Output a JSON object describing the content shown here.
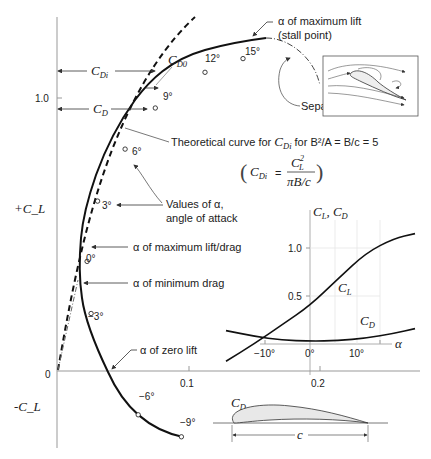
{
  "chart_data": {
    "type": "line",
    "xlabel": "C_D",
    "ylabel_positive": "+C_L",
    "ylabel_negative": "-C_L",
    "xlim": [
      0,
      0.3
    ],
    "ylim": [
      -0.3,
      1.3
    ],
    "x_ticks": [
      "0.1",
      "0.2"
    ],
    "y_ticks": [
      "1.0"
    ],
    "origin_label": "0",
    "series": [
      {
        "name": "Measured drag polar",
        "style": "solid",
        "points": [
          {
            "alpha": "-9°",
            "cd": 0.095,
            "cl": -0.24
          },
          {
            "alpha": "-6°",
            "cd": 0.062,
            "cl": -0.16
          },
          {
            "alpha": "-3°",
            "cd": 0.026,
            "cl": 0.21
          },
          {
            "alpha": "0°",
            "cd": 0.023,
            "cl": 0.4
          },
          {
            "alpha": "3°",
            "cd": 0.031,
            "cl": 0.62
          },
          {
            "alpha": "6°",
            "cd": 0.052,
            "cl": 0.81
          },
          {
            "alpha": "9°",
            "cd": 0.075,
            "cl": 0.96
          },
          {
            "alpha": "12°",
            "cd": 0.113,
            "cl": 1.09
          },
          {
            "alpha": "15°",
            "cd": 0.142,
            "cl": 1.14
          }
        ]
      },
      {
        "name": "Theoretical curve for C_Di",
        "style": "dashed",
        "points": [
          {
            "cd": 0.0,
            "cl": 0.0
          },
          {
            "cd": 0.01,
            "cl": 0.25
          },
          {
            "cd": 0.025,
            "cl": 0.5
          },
          {
            "cd": 0.045,
            "cl": 0.75
          },
          {
            "cd": 0.065,
            "cl": 1.0
          },
          {
            "cd": 0.09,
            "cl": 1.22
          }
        ]
      }
    ],
    "annotations": {
      "max_lift": "α of maximum lift",
      "max_lift_sub": "(stall point)",
      "separation": "Separation",
      "theory_line": "Theoretical curve for",
      "theory_cdi": "C",
      "theory_cdi_sub": "Di",
      "theory_rest": " for B²/A = B/c = 5",
      "formula_lhs": "C",
      "formula_lhs_sub": "Di",
      "formula_eq": "=",
      "formula_num": "C",
      "formula_num_sup": "2",
      "formula_num_sub": "L",
      "formula_den": "πB/c",
      "values_alpha_1": "Values of α,",
      "values_alpha_2": "angle of attack",
      "max_lift_drag": "α of maximum lift/drag",
      "min_drag": "α of minimum drag",
      "zero_lift": "α of zero lift",
      "cdi_label": "C",
      "cdi_sub": "Di",
      "cd0_label": "C",
      "cd0_sub": "D0",
      "cd_label": "C",
      "cd_sub": "D",
      "chord_label": "c"
    },
    "inset": {
      "type": "line",
      "ylabel": "C_L, C_D",
      "ylabel_main": "C",
      "ylabel_sub1": "L",
      "ylabel_sep": ", C",
      "ylabel_sub2": "D",
      "xlabel": "α",
      "x_ticks": [
        "−10°",
        "0°",
        "10°"
      ],
      "y_ticks": [
        "0.5",
        "1.0"
      ],
      "xlim": [
        -12,
        15
      ],
      "ylim": [
        -0.2,
        1.3
      ],
      "series": [
        {
          "name": "C_L",
          "label_main": "C",
          "label_sub": "L",
          "x": [
            -12,
            -8,
            -4,
            0,
            4,
            8,
            12,
            15
          ],
          "y": [
            -0.18,
            0.0,
            0.2,
            0.4,
            0.68,
            0.95,
            1.1,
            1.15
          ]
        },
        {
          "name": "C_D",
          "label_main": "C",
          "label_sub": "D",
          "x": [
            -12,
            -8,
            -4,
            0,
            4,
            8,
            12,
            15
          ],
          "y": [
            0.14,
            0.08,
            0.04,
            0.03,
            0.035,
            0.06,
            0.11,
            0.16
          ]
        }
      ]
    }
  }
}
